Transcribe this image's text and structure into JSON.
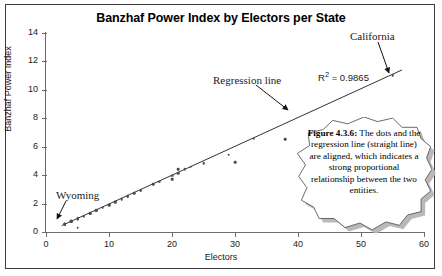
{
  "figure": {
    "title": "Banzhaf Power Index by Electors per State",
    "x_axis_label": "Electors",
    "y_axis_label": "Banzhaf Power Index",
    "r_squared_label": "R",
    "r_squared_sup": "2",
    "r_squared_value": " = 0.9865"
  },
  "annotations": {
    "california": "California",
    "regression_line": "Regression line",
    "wyoming": "Wyoming"
  },
  "callout": {
    "heading": "Figure 4.3.6:",
    "body": " The dots and the regression line (straight line) are aligned, which indicates a strong proportional relationship between the two entities.",
    "full_text": "Figure 4.3.6: The dots and the regression line (straight line) are aligned, which indicates a strong proportional relationship between the two entities."
  },
  "chart_data": {
    "type": "scatter",
    "title": "Banzhaf Power Index by Electors per State",
    "xlabel": "Electors",
    "ylabel": "Banzhaf Power Index",
    "xlim": [
      0,
      60
    ],
    "ylim": [
      0,
      14
    ],
    "xticks": [
      0,
      10,
      20,
      30,
      40,
      50,
      60
    ],
    "yticks": [
      0,
      2,
      4,
      6,
      8,
      10,
      12,
      14
    ],
    "grid": false,
    "legend": false,
    "r_squared": 0.9865,
    "series": [
      {
        "name": "States",
        "marker": "dot",
        "color": "#4a4a4a",
        "points": [
          [
            3,
            0.52
          ],
          [
            3,
            0.54
          ],
          [
            3,
            0.55
          ],
          [
            3,
            0.56
          ],
          [
            3,
            0.57
          ],
          [
            3,
            0.58
          ],
          [
            4,
            0.72
          ],
          [
            4,
            0.74
          ],
          [
            4,
            0.75
          ],
          [
            5,
            0.3
          ],
          [
            5,
            0.92
          ],
          [
            5,
            0.94
          ],
          [
            5,
            0.95
          ],
          [
            6,
            1.12
          ],
          [
            7,
            1.3
          ],
          [
            7,
            1.32
          ],
          [
            8,
            1.5
          ],
          [
            8,
            1.52
          ],
          [
            9,
            1.7
          ],
          [
            10,
            1.9
          ],
          [
            10,
            1.92
          ],
          [
            11,
            2.1
          ],
          [
            11,
            2.12
          ],
          [
            12,
            2.32
          ],
          [
            13,
            2.5
          ],
          [
            13,
            2.52
          ],
          [
            14,
            2.72
          ],
          [
            15,
            2.9
          ],
          [
            15,
            2.92
          ],
          [
            17,
            3.35
          ],
          [
            18,
            3.55
          ],
          [
            20,
            3.72
          ],
          [
            20,
            3.96
          ],
          [
            21,
            4.15
          ],
          [
            21,
            4.4
          ],
          [
            22,
            4.4
          ],
          [
            23,
            4.58
          ],
          [
            25,
            4.85
          ],
          [
            29,
            5.45
          ],
          [
            30,
            4.92
          ],
          [
            33,
            6.55
          ],
          [
            38,
            6.52
          ],
          [
            55,
            11.05
          ]
        ]
      }
    ],
    "trendline": {
      "name": "Regression line",
      "type": "linear",
      "x_start": 2.5,
      "y_start": 0.45,
      "x_end": 56.5,
      "y_end": 11.4,
      "color": "#333333"
    },
    "annotations": [
      {
        "text": "California",
        "target_x": 55,
        "target_y": 11.05
      },
      {
        "text": "Regression line",
        "target_x": 40,
        "target_y": 7.9
      },
      {
        "text": "Wyoming",
        "target_x": 3,
        "target_y": 0.55
      }
    ]
  }
}
